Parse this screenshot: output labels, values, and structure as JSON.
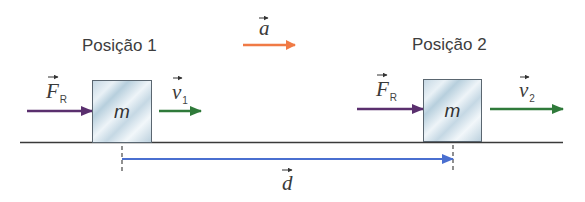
{
  "labels": {
    "position_1": "Posição 1",
    "position_2": "Posição 2"
  },
  "vectors": {
    "acceleration": {
      "symbol": "a",
      "subscript": "",
      "color": "#f07a45"
    },
    "resultant_force_1": {
      "symbol": "F",
      "subscript": "R",
      "color": "#5a2f6e"
    },
    "resultant_force_2": {
      "symbol": "F",
      "subscript": "R",
      "color": "#5a2f6e"
    },
    "velocity_1": {
      "symbol": "v",
      "subscript": "1",
      "color": "#2f7a3a"
    },
    "velocity_2": {
      "symbol": "v",
      "subscript": "2",
      "color": "#2f7a3a"
    },
    "displacement": {
      "symbol": "d",
      "subscript": "",
      "color": "#4a6fd0"
    }
  },
  "blocks": {
    "block_1": {
      "label": "m"
    },
    "block_2": {
      "label": "m"
    }
  },
  "colors": {
    "ground": "#3a3a3a",
    "marker": "#555555"
  }
}
